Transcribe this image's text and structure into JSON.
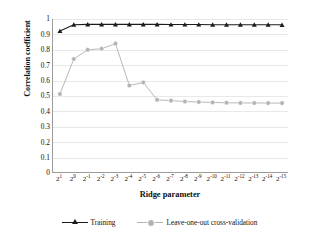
{
  "chart_data": {
    "type": "line",
    "title": "",
    "xlabel": "Ridge parameter",
    "ylabel": "Correlation coefficient",
    "ylim": [
      0,
      1
    ],
    "ytick_labels": [
      "1",
      "0.9",
      "0.8",
      "0.7",
      "0.6",
      "0.5",
      "0.4",
      "0.3",
      "0.2",
      "0.1",
      "0"
    ],
    "ytick_values": [
      1,
      0.9,
      0.8,
      0.7,
      0.6,
      0.5,
      0.4,
      0.3,
      0.2,
      0.1,
      0
    ],
    "grid": "horizontal",
    "legend_position": "bottom",
    "categories": [
      "2^1",
      "2^0",
      "2^-1",
      "2^-2",
      "2^-3",
      "2^-4",
      "2^-5",
      "2^-6",
      "2^-7",
      "2^-8",
      "2^-9",
      "2^-10",
      "2^-11",
      "2^-12",
      "2^-13",
      "2^-14",
      "2^-15"
    ],
    "category_bases": [
      "2",
      "2",
      "2",
      "2",
      "2",
      "2",
      "2",
      "2",
      "2",
      "2",
      "2",
      "2",
      "2",
      "2",
      "2",
      "2",
      "2"
    ],
    "category_exponents": [
      "1",
      "0",
      "-1",
      "-2",
      "-3",
      "-4",
      "-5",
      "-6",
      "-7",
      "-8",
      "-9",
      "-10",
      "-11",
      "-12",
      "-13",
      "-14",
      "-15"
    ],
    "series": [
      {
        "name": "Training",
        "color": "#1c1c1c",
        "marker": "triangle",
        "values": [
          0.922,
          0.963,
          0.965,
          0.965,
          0.965,
          0.965,
          0.965,
          0.965,
          0.964,
          0.964,
          0.964,
          0.963,
          0.963,
          0.963,
          0.963,
          0.963,
          0.962
        ]
      },
      {
        "name": "Leave-one-out cross-validation",
        "color": "#b3b3b3",
        "marker": "circle",
        "values": [
          0.513,
          0.74,
          0.8,
          0.807,
          0.84,
          0.568,
          0.588,
          0.475,
          0.47,
          0.464,
          0.461,
          0.458,
          0.456,
          0.455,
          0.455,
          0.454,
          0.454
        ]
      }
    ]
  },
  "legend": {
    "items": [
      {
        "label": "Training"
      },
      {
        "label": "Leave-one-out cross-validation"
      }
    ]
  }
}
